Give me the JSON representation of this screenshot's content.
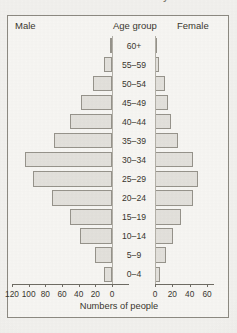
{
  "caption": {
    "text": "of B levels in a South American city"
  },
  "header": {
    "male_label": "Male",
    "age_group_label": "Age group",
    "female_label": "Female"
  },
  "axis": {
    "title": "Numbers of people",
    "left_ticks": [
      "120",
      "100",
      "80",
      "60",
      "40",
      "20",
      "0"
    ],
    "right_ticks": [
      "0",
      "20",
      "40",
      "60"
    ]
  },
  "chart_data": {
    "type": "bar",
    "subtype": "population-pyramid",
    "title": "",
    "xlabel": "Numbers of people",
    "ylabel": "Age group",
    "orientation": "horizontal",
    "grid": false,
    "legend_position": "top",
    "categories": [
      "60+",
      "55–59",
      "50–54",
      "45–49",
      "40–44",
      "35–39",
      "30–34",
      "25–29",
      "20–24",
      "15–19",
      "10–14",
      "5–9",
      "0–4"
    ],
    "series": [
      {
        "name": "Male",
        "side": "left",
        "axis_range": [
          0,
          120
        ],
        "axis_ticks": [
          120,
          100,
          80,
          60,
          40,
          20,
          0
        ],
        "values": [
          2,
          10,
          23,
          37,
          50,
          70,
          105,
          95,
          72,
          50,
          38,
          20,
          10
        ]
      },
      {
        "name": "Female",
        "side": "right",
        "axis_range": [
          0,
          60
        ],
        "axis_ticks": [
          0,
          20,
          40,
          60
        ],
        "values": [
          1,
          5,
          11,
          15,
          18,
          26,
          44,
          50,
          44,
          30,
          21,
          13,
          6
        ]
      }
    ]
  },
  "colors": {
    "bar_fill": "#e3e1dc",
    "bar_border": "#96938b",
    "axis": "#6f6c64",
    "text": "#3a372f",
    "panel": "#f7f6f3",
    "page": "#f2f1ee"
  }
}
